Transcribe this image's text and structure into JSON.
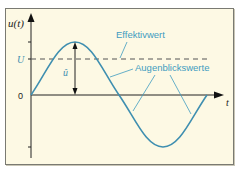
{
  "diagram": {
    "y_axis_label": "u(t)",
    "x_axis_label": "t",
    "origin_label": "0",
    "rms_level_label": "U",
    "amplitude_label": "û",
    "annotations": {
      "rms": "Effektivwert",
      "instantaneous": "Augenblickswerte"
    },
    "colors": {
      "background": "#fdf9e4",
      "curve": "#3f8fb0",
      "annotation_text": "#3f9cc0",
      "axis": "#222222",
      "dashed_line": "#555555",
      "frame_border": "#7a7a72"
    }
  }
}
